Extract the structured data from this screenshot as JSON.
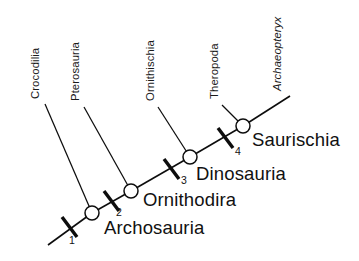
{
  "figure": {
    "type": "cladogram",
    "background_color": "#ffffff",
    "line_color": "#0d0d0d",
    "text_color": "#111111",
    "width": 359,
    "height": 261
  },
  "taxa": [
    {
      "id": "crocodilia",
      "label": "Crocodilia",
      "italic": false,
      "label_x": 33,
      "label_y": 98,
      "branch": {
        "x1": 45,
        "y1": 104,
        "x2": 92,
        "y2": 213
      }
    },
    {
      "id": "pterosauria",
      "label": "Pterosauria",
      "italic": false,
      "label_y": 103,
      "label_x": 78,
      "branch": {
        "x1": 84,
        "y1": 107,
        "x2": 131,
        "y2": 191
      }
    },
    {
      "id": "ornithischia",
      "label": "Ornithischia",
      "italic": false,
      "label_x": 153,
      "label_y": 105,
      "branch": {
        "x1": 158,
        "y1": 107,
        "x2": 190,
        "y2": 157
      }
    },
    {
      "id": "theropoda",
      "label": "Theropoda",
      "italic": false,
      "label_x": 218,
      "label_y": 102,
      "branch": {
        "x1": 222,
        "y1": 105,
        "x2": 243,
        "y2": 126
      }
    },
    {
      "id": "archaeopteryx",
      "label": "Archaeopteryx",
      "italic": true,
      "label_x": 272,
      "label_y": 98,
      "branch": {
        "x1": 243,
        "y1": 126,
        "x2": 290,
        "y2": 96
      }
    }
  ],
  "clades": [
    {
      "id": "archosauria",
      "number": "1",
      "label": "Archosauria",
      "node_x": 92,
      "node_y": 213,
      "label_x": 104,
      "label_y": 234,
      "number_x": 72,
      "number_y": 244,
      "tick_x": 69,
      "tick_y": 227
    },
    {
      "id": "ornithodira",
      "number": "2",
      "label": "Ornithodira",
      "node_x": 131,
      "node_y": 191,
      "label_x": 143,
      "label_y": 206,
      "number_x": 119,
      "number_y": 214,
      "tick_x": 111,
      "tick_y": 201
    },
    {
      "id": "dinosauria",
      "number": "3",
      "label": "Dinosauria",
      "node_x": 190,
      "node_y": 157,
      "label_x": 196,
      "label_y": 180,
      "number_x": 181,
      "number_y": 183,
      "tick_x": 171,
      "tick_y": 169
    },
    {
      "id": "saurischia",
      "number": "4",
      "label": "Saurischia",
      "node_x": 243,
      "node_y": 126,
      "label_x": 252,
      "label_y": 146,
      "number_x": 236,
      "number_y": 153,
      "tick_x": 225,
      "tick_y": 138
    }
  ],
  "spine": {
    "root_x": 48,
    "root_y": 245,
    "tip_x": 290,
    "tip_y": 96,
    "description": "Main backbone from root through Archosauria, Ornithodira, Dinosauria, Saurischia to Archaeopteryx"
  },
  "node_radius": 7,
  "tick_half_length": 11,
  "legend": {
    "tick_meaning": "numbered synapomorphy marks",
    "node_meaning": "open circle = common ancestor node"
  }
}
